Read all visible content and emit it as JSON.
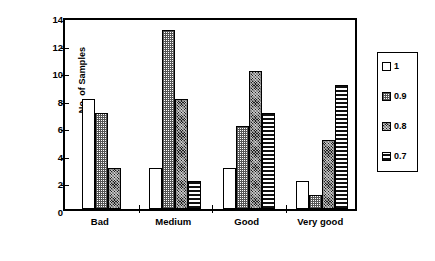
{
  "chart_data": {
    "type": "bar",
    "title": "",
    "xlabel": "",
    "ylabel": "No. of Samples",
    "ylim": [
      0,
      14
    ],
    "ytick_values": [
      0,
      2,
      4,
      6,
      8,
      10,
      12,
      14
    ],
    "ytick_labels": [
      "0",
      "2",
      "4",
      "6",
      "8",
      "10",
      "12",
      "14"
    ],
    "grid": false,
    "legend_position": "right-outside",
    "categories": [
      "Bad",
      "Medium",
      "Good",
      "Very good"
    ],
    "series": [
      {
        "name": "1",
        "values": [
          8,
          3,
          3,
          2
        ],
        "pattern": "solid-white"
      },
      {
        "name": "0.9",
        "values": [
          7,
          13,
          6,
          1
        ],
        "pattern": "dot-light"
      },
      {
        "name": "0.8",
        "values": [
          3,
          8,
          10,
          5
        ],
        "pattern": "dot-dark"
      },
      {
        "name": "0.7",
        "values": [
          0,
          2,
          7,
          9
        ],
        "pattern": "hstripe"
      }
    ]
  },
  "legend": {
    "entries": [
      {
        "label": "1"
      },
      {
        "label": "0.9"
      },
      {
        "label": "0.8"
      },
      {
        "label": "0.7"
      }
    ]
  }
}
